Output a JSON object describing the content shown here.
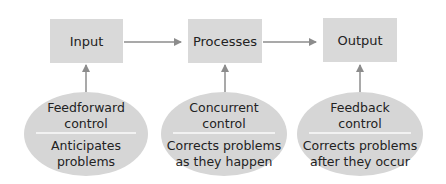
{
  "diagram": {
    "boxes": [
      {
        "id": "input",
        "label": "Input"
      },
      {
        "id": "processes",
        "label": "Processes"
      },
      {
        "id": "output",
        "label": "Output"
      }
    ],
    "controls": [
      {
        "title_line1": "Feedforward",
        "title_line2": "control",
        "desc_line1": "Anticipates",
        "desc_line2": "problems"
      },
      {
        "title_line1": "Concurrent",
        "title_line2": "control",
        "desc_line1": "Corrects problems",
        "desc_line2": "as they happen"
      },
      {
        "title_line1": "Feedback",
        "title_line2": "control",
        "desc_line1": "Corrects problems",
        "desc_line2": "after they occur"
      }
    ],
    "colors": {
      "box_fill": "#d9d9d9",
      "ellipse_fill": "#d6d6d6",
      "arrow": "#8c8c8c"
    }
  }
}
